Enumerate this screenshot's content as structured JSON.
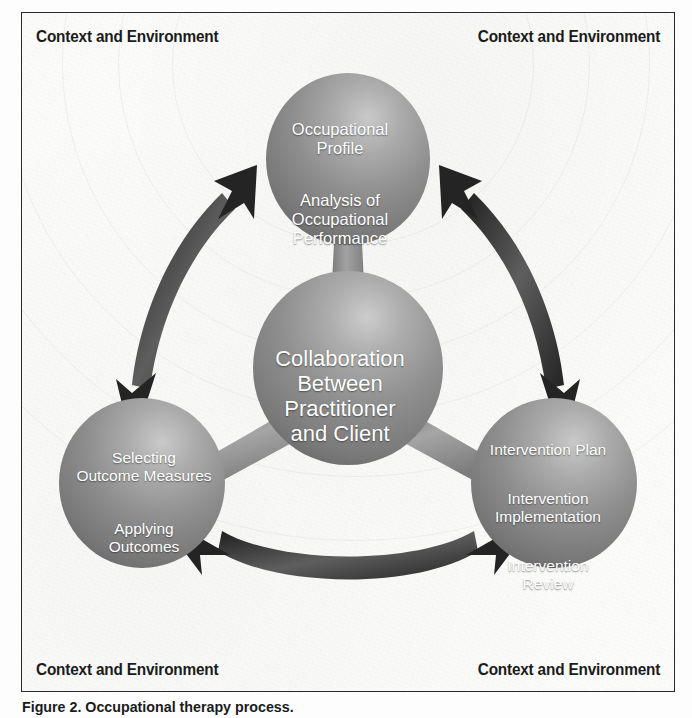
{
  "figure": {
    "caption": "Figure 2. Occupational therapy process.",
    "frame_border_color": "#2a2a2a",
    "background_color": "#fbfbfa"
  },
  "corner_labels": {
    "top_left": "Context and Environment",
    "top_right": "Context and Environment",
    "bottom_left": "Context and Environment",
    "bottom_right": "Context and Environment"
  },
  "nodes": [
    {
      "id": "assessment",
      "name": "evaluation-node",
      "position": "top",
      "fill_color": "#8a8a8a",
      "text_color": "#ffffff",
      "lines_group_1": "Occupational\nProfile",
      "lines_group_2": "Analysis of\nOccupational\nPerformance"
    },
    {
      "id": "center",
      "name": "collaboration-node",
      "position": "center",
      "fill_color": "#8a8a8a",
      "text_color": "#ffffff",
      "lines_group_1": "Collaboration\nBetween\nPractitioner\nand Client"
    },
    {
      "id": "outcomes",
      "name": "outcomes-node",
      "position": "bottom-left",
      "fill_color": "#8a8a8a",
      "text_color": "#ffffff",
      "lines_group_1": "Selecting\nOutcome Measures",
      "lines_group_2": "Applying\nOutcomes"
    },
    {
      "id": "intervention",
      "name": "intervention-node",
      "position": "bottom-right",
      "fill_color": "#8a8a8a",
      "text_color": "#ffffff",
      "lines_group_1": "Intervention Plan",
      "lines_group_2": "Intervention\nImplementation",
      "lines_group_3": "Intervention\nReview"
    }
  ],
  "connectors": {
    "arrow_color": "#2b2b2b",
    "stem_color": "#8f8f8f",
    "arrows": [
      {
        "name": "arrow-top-to-bottom-left",
        "bidirectional": true
      },
      {
        "name": "arrow-top-to-bottom-right",
        "bidirectional": true
      },
      {
        "name": "arrow-bottom-left-to-bottom-right",
        "bidirectional": true
      }
    ],
    "stems": [
      {
        "name": "stem-center-to-top"
      },
      {
        "name": "stem-center-to-bottom-left"
      },
      {
        "name": "stem-center-to-bottom-right"
      }
    ]
  }
}
